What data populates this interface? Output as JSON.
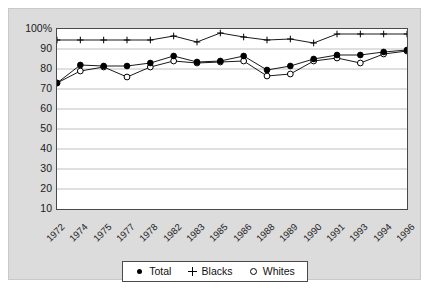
{
  "chart_data": {
    "type": "line",
    "title": "",
    "xlabel": "",
    "ylabel": "",
    "ylim": [
      10,
      100
    ],
    "ytick_step": 10,
    "grid": true,
    "legend_position": "bottom",
    "ytick_labels": [
      "100%",
      "90",
      "80",
      "70",
      "60",
      "50",
      "40",
      "30",
      "20",
      "10"
    ],
    "categories": [
      "1972",
      "1974",
      "1975",
      "1977",
      "1978",
      "1982",
      "1983",
      "1985",
      "1986",
      "1988",
      "1989",
      "1990",
      "1991",
      "1993",
      "1994",
      "1996"
    ],
    "series": [
      {
        "name": "Total",
        "marker": "filled-circle",
        "values": [
          73,
          82,
          81.5,
          81.5,
          83,
          86.5,
          83.5,
          84,
          86.5,
          79.5,
          81.5,
          85,
          87,
          87,
          88.5,
          89.5
        ]
      },
      {
        "name": "Blacks",
        "marker": "plus",
        "values": [
          94.5,
          94.5,
          94.5,
          94.5,
          94.5,
          96.5,
          93.5,
          98,
          96,
          94.5,
          95,
          93,
          97.5,
          97.5,
          97.5,
          97.5
        ]
      },
      {
        "name": "Whites",
        "marker": "open-circle",
        "values": [
          73,
          79,
          81,
          76,
          81,
          84,
          83,
          83.5,
          84,
          76.5,
          77.5,
          84,
          85.5,
          83,
          87.5,
          89
        ]
      }
    ]
  },
  "legend": {
    "items": [
      {
        "label": "Total",
        "marker": "filled-circle"
      },
      {
        "label": "Blacks",
        "marker": "plus"
      },
      {
        "label": "Whites",
        "marker": "open-circle"
      }
    ]
  },
  "colors": {
    "panel_background": "#dcdcdc",
    "plot_background": "#ffffff",
    "axis": "#4a4a4a",
    "gridline": "#c0c0c0",
    "series": "#000000",
    "text": "#1b1b1b"
  }
}
